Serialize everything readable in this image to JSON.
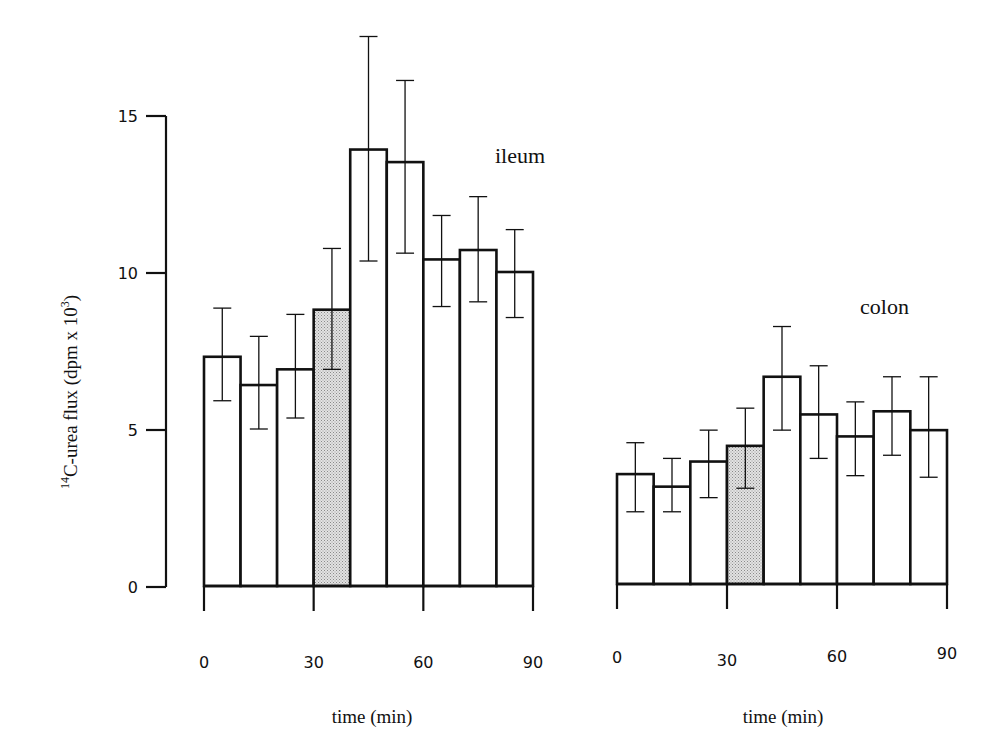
{
  "chart_data": [
    {
      "type": "bar",
      "title": "ileum",
      "xlabel": "time (min)",
      "ylabel": "14C-urea flux (dpm x 10^3)",
      "ylabel_parts": {
        "sup": "14",
        "main": "C-urea flux (dpm x 10",
        "exp": "3",
        "close": ")"
      },
      "categories": [
        "0-10",
        "10-20",
        "20-30",
        "30-40",
        "40-50",
        "50-60",
        "60-70",
        "70-80",
        "80-90"
      ],
      "values": [
        7.3,
        6.4,
        6.9,
        8.8,
        13.9,
        13.5,
        10.4,
        10.7,
        10.0
      ],
      "error_upper": [
        8.85,
        7.95,
        8.65,
        10.75,
        17.5,
        16.1,
        11.8,
        12.4,
        11.35
      ],
      "error_lower": [
        5.9,
        5.0,
        5.35,
        6.9,
        10.35,
        10.6,
        8.9,
        9.05,
        8.55
      ],
      "highlighted": [
        false,
        false,
        false,
        true,
        false,
        false,
        false,
        false,
        false
      ],
      "xticks": [
        0,
        30,
        60,
        90
      ],
      "yticks": [
        0,
        5,
        10,
        15
      ],
      "xlim": [
        0,
        90
      ],
      "ylim": [
        0,
        15
      ],
      "grid": false,
      "legend": null
    },
    {
      "type": "bar",
      "title": "colon",
      "xlabel": "time (min)",
      "ylabel": "14C-urea flux (dpm x 10^3)",
      "categories": [
        "0-10",
        "10-20",
        "20-30",
        "30-40",
        "40-50",
        "50-60",
        "60-70",
        "70-80",
        "80-90"
      ],
      "values": [
        3.5,
        3.1,
        3.9,
        4.4,
        6.6,
        5.4,
        4.7,
        5.5,
        4.9
      ],
      "error_upper": [
        4.5,
        4.0,
        4.9,
        5.6,
        8.2,
        6.95,
        5.8,
        6.6,
        6.6
      ],
      "error_lower": [
        2.3,
        2.3,
        2.75,
        3.05,
        4.9,
        4.0,
        3.45,
        4.1,
        3.4
      ],
      "highlighted": [
        false,
        false,
        false,
        true,
        false,
        false,
        false,
        false,
        false
      ],
      "xticks": [
        0,
        30,
        60,
        90
      ],
      "xlim": [
        0,
        90
      ],
      "ylim": [
        0,
        15
      ],
      "grid": false,
      "legend": null
    }
  ],
  "panels": {
    "ileum": {
      "label": "ileum",
      "xlabel": "time (min)",
      "xtick_labels": [
        "0",
        "30",
        "60",
        "90"
      ],
      "ytick_labels": [
        "0",
        "5",
        "10",
        "15"
      ]
    },
    "colon": {
      "label": "colon",
      "xlabel": "time (min)",
      "xtick_labels": [
        "0",
        "30",
        "60",
        "90"
      ]
    }
  },
  "yaxis_title": {
    "sup": "14",
    "main": "C-urea flux (dpm x 10",
    "exp": "3",
    "close": ")"
  },
  "colors": {
    "bar_fill": "#ffffff",
    "highlight_fill": "#c9c9c9",
    "stroke": "#111111"
  }
}
